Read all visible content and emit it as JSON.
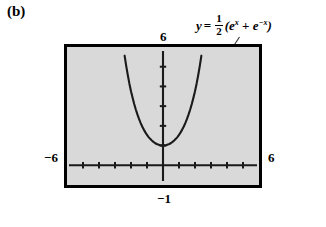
{
  "figure": {
    "panel_letter": "(b)",
    "annotation": {
      "lhs": "y",
      "equals": "=",
      "fraction_numerator": "1",
      "fraction_denominator": "2",
      "open_paren": "(",
      "term1_base": "e",
      "term1_exp": "x",
      "operator": "+",
      "term2_base": "e",
      "term2_exp": "−x",
      "close_paren": ")",
      "full_text": "y = 1/2(e^x + e^-x)"
    },
    "screen": {
      "background_color": "#d9d9d9",
      "border_color": "#000000"
    },
    "window_labels": {
      "ymax": "6",
      "xmin": "−6",
      "xmax": "6",
      "ymin": "−1"
    }
  },
  "chart_data": {
    "type": "line",
    "title": "",
    "subtitle": "",
    "xlabel": "",
    "ylabel": "",
    "function": "y = (1/2)(e^x + e^-x)",
    "function_name": "hyperbolic cosine (catenary)",
    "xlim": [
      -6,
      6
    ],
    "ylim": [
      -1,
      6
    ],
    "grid": false,
    "legend": "none",
    "axis_ticks": {
      "x_tick_spacing": 1,
      "x_ticks": [
        -5,
        -4,
        -3,
        -2,
        -1,
        0,
        1,
        2,
        3,
        4,
        5
      ],
      "y_tick_spacing": 1,
      "y_ticks": [
        1,
        2,
        3,
        4,
        5
      ]
    },
    "annotations": [
      {
        "text": "y = 1/2(e^x + e^-x)",
        "points_to_x": 2.45,
        "points_to_y": 5.9
      }
    ],
    "x": [
      -2.5,
      -2.4,
      -2.3,
      -2.2,
      -2.1,
      -2.0,
      -1.9,
      -1.8,
      -1.7,
      -1.6,
      -1.5,
      -1.4,
      -1.3,
      -1.2,
      -1.1,
      -1.0,
      -0.9,
      -0.8,
      -0.7,
      -0.6,
      -0.5,
      -0.4,
      -0.3,
      -0.2,
      -0.1,
      0.0,
      0.1,
      0.2,
      0.3,
      0.4,
      0.5,
      0.6,
      0.7,
      0.8,
      0.9,
      1.0,
      1.1,
      1.2,
      1.3,
      1.4,
      1.5,
      1.6,
      1.7,
      1.8,
      1.9,
      2.0,
      2.1,
      2.2,
      2.3,
      2.4,
      2.5
    ],
    "y": [
      6.13,
      5.56,
      5.04,
      4.57,
      4.14,
      3.76,
      3.42,
      3.11,
      2.83,
      2.58,
      2.35,
      2.15,
      1.97,
      1.81,
      1.67,
      1.54,
      1.43,
      1.34,
      1.26,
      1.19,
      1.13,
      1.08,
      1.05,
      1.02,
      1.01,
      1.0,
      1.01,
      1.02,
      1.05,
      1.08,
      1.13,
      1.19,
      1.26,
      1.34,
      1.43,
      1.54,
      1.67,
      1.81,
      1.97,
      2.15,
      2.35,
      2.58,
      2.83,
      3.11,
      3.42,
      3.76,
      4.14,
      4.57,
      5.04,
      5.56,
      6.13
    ],
    "minimum_point": [
      0,
      1
    ]
  }
}
